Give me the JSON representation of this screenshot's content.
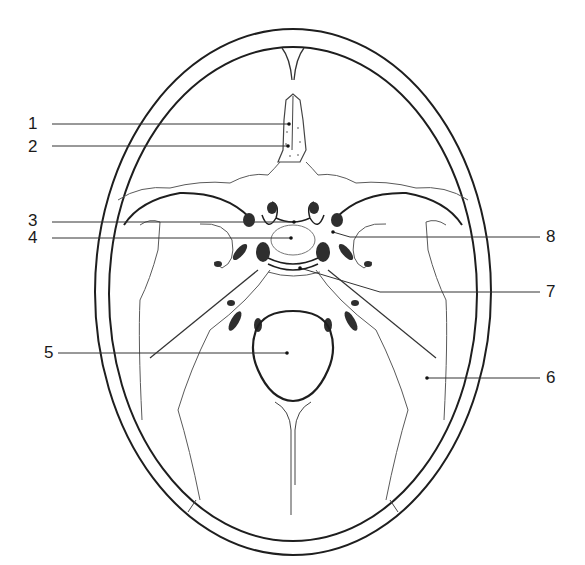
{
  "diagram": {
    "colors": {
      "outline": "#1e1e1e",
      "suture": "#5a5a5a",
      "foramen_fill": "#2e2e2e",
      "leader": "#333333"
    },
    "labels": [
      {
        "id": "1",
        "text": "1",
        "side": "left",
        "x": 28,
        "y": 115,
        "target": [
          289,
          124
        ]
      },
      {
        "id": "2",
        "text": "2",
        "side": "left",
        "x": 28,
        "y": 138,
        "target": [
          288,
          146
        ]
      },
      {
        "id": "3",
        "text": "3",
        "side": "left",
        "x": 28,
        "y": 212,
        "target": [
          294,
          222
        ]
      },
      {
        "id": "4",
        "text": "4",
        "side": "left",
        "x": 28,
        "y": 229,
        "target": [
          291,
          238
        ]
      },
      {
        "id": "5",
        "text": "5",
        "side": "left",
        "x": 44,
        "y": 344,
        "target": [
          287,
          353
        ]
      },
      {
        "id": "6",
        "text": "6",
        "side": "right",
        "x": 546,
        "y": 369,
        "target": [
          427,
          378
        ]
      },
      {
        "id": "7",
        "text": "7",
        "side": "right",
        "x": 546,
        "y": 283,
        "target": [
          300,
          268
        ]
      },
      {
        "id": "8",
        "text": "8",
        "side": "right",
        "x": 546,
        "y": 228,
        "target": [
          333,
          232
        ]
      }
    ]
  }
}
